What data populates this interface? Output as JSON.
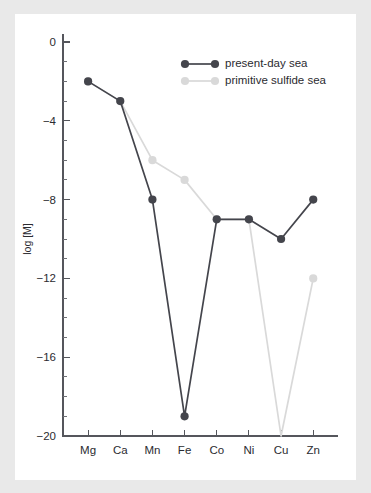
{
  "figure": {
    "background_color": "#e9e9e9",
    "panel_color": "#ffffff",
    "axis_color": "#55565c"
  },
  "chart_data": {
    "type": "line",
    "title": "",
    "subtitle": "",
    "xlabel": "",
    "ylabel": "log [M]",
    "categories": [
      "Mg",
      "Ca",
      "Mn",
      "Fe",
      "Co",
      "Ni",
      "Cu",
      "Zn"
    ],
    "ylim": [
      -20,
      0
    ],
    "yticks": [
      0,
      -4,
      -8,
      -12,
      -16,
      -20
    ],
    "ytick_labels": [
      "0",
      "−4",
      "−8",
      "−12",
      "−16",
      "−20"
    ],
    "yminor_step": 1,
    "grid": false,
    "legend_position": "top-right",
    "series": [
      {
        "name": "present-day sea",
        "color": "#44454c",
        "values": [
          -2,
          -3,
          -8,
          -19,
          -9,
          -9,
          -10,
          -8
        ]
      },
      {
        "name": "primitive sulfide sea",
        "color": "#d9d9d9",
        "values": [
          -2,
          -3,
          -6,
          -7,
          -9,
          -9,
          -20,
          -12
        ]
      }
    ]
  },
  "legend": {
    "items": [
      {
        "label": "present-day sea",
        "color": "#44454c"
      },
      {
        "label": "primitive sulfide sea",
        "color": "#d9d9d9"
      }
    ]
  }
}
